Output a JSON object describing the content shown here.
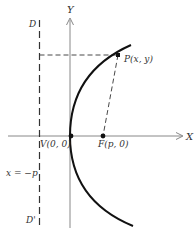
{
  "figure": {
    "colors": {
      "ink": "#111111",
      "axis": "#777777",
      "dash": "#333333",
      "text": "#333333"
    },
    "axes": {
      "x_label": "X",
      "y_label": "Y"
    },
    "labels": {
      "directrix_top": "D",
      "directrix_bottom": "D'",
      "directrix_equation": "x = −p",
      "vertex": "V(0, 0)",
      "focus": "F(p, 0)",
      "point": "P(x, y)"
    }
  }
}
